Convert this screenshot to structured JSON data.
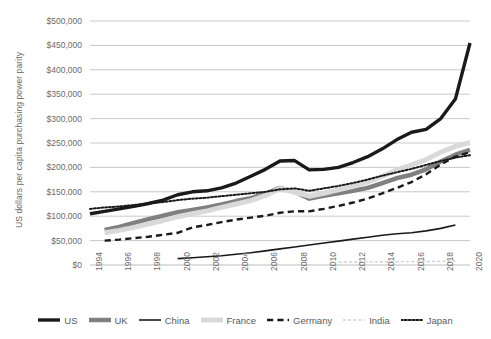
{
  "chart_data": {
    "type": "line",
    "title": "",
    "xlabel": "",
    "ylabel": "US dollars per capita purchasing power parity",
    "xlim": [
      1994,
      2020
    ],
    "ylim": [
      0,
      500000
    ],
    "ytick_labels": [
      "$500,000",
      "$450,000",
      "$400,000",
      "$350,000",
      "$300,000",
      "$250,000",
      "$200,000",
      "$150,000",
      "$100,000",
      "$50,000",
      "$0"
    ],
    "ytick_values": [
      500000,
      450000,
      400000,
      350000,
      300000,
      250000,
      200000,
      150000,
      100000,
      50000,
      0
    ],
    "xtick_labels": [
      "1994",
      "1996",
      "1998",
      "2000",
      "2002",
      "2004",
      "2006",
      "2008",
      "2010",
      "2012",
      "2014",
      "2016",
      "2018",
      "2020"
    ],
    "xtick_values": [
      1994,
      1996,
      1998,
      2000,
      2002,
      2004,
      2006,
      2008,
      2010,
      2012,
      2014,
      2016,
      2018,
      2020
    ],
    "grid": "horizontal",
    "legend_position": "bottom",
    "x": [
      1994,
      1995,
      1996,
      1997,
      1998,
      1999,
      2000,
      2001,
      2002,
      2003,
      2004,
      2005,
      2006,
      2007,
      2008,
      2009,
      2010,
      2011,
      2012,
      2013,
      2014,
      2015,
      2016,
      2017,
      2018,
      2019,
      2020
    ],
    "series": [
      {
        "name": "US",
        "color": "#1a1a1a",
        "style": "solid",
        "width": 3.4,
        "values": [
          105000,
          110000,
          115000,
          120000,
          126000,
          133000,
          144000,
          150000,
          152000,
          158000,
          168000,
          182000,
          196000,
          213000,
          214000,
          195000,
          196000,
          200000,
          210000,
          222000,
          238000,
          257000,
          272000,
          278000,
          300000,
          340000,
          455000
        ]
      },
      {
        "name": "UK",
        "color": "#808080",
        "style": "solid",
        "width": 4.5,
        "values": [
          null,
          72000,
          78000,
          86000,
          94000,
          101000,
          108000,
          113000,
          118000,
          124000,
          131000,
          137000,
          146000,
          158000,
          150000,
          136000,
          142000,
          147000,
          152000,
          158000,
          168000,
          178000,
          185000,
          196000,
          212000,
          226000,
          236000
        ]
      },
      {
        "name": "China",
        "color": "#1a1a1a",
        "style": "solid",
        "width": 1.6,
        "values": [
          null,
          null,
          null,
          null,
          null,
          null,
          13000,
          15000,
          17000,
          19000,
          22000,
          25000,
          29000,
          33000,
          37000,
          41000,
          45000,
          49000,
          53000,
          57000,
          61000,
          64000,
          66000,
          70000,
          75000,
          82000,
          null
        ]
      },
      {
        "name": "France",
        "color": "#d9d9d9",
        "style": "solid",
        "width": 5.0,
        "values": [
          null,
          66000,
          71000,
          77000,
          84000,
          91000,
          99000,
          105000,
          111000,
          118000,
          125000,
          132000,
          142000,
          157000,
          149000,
          141000,
          147000,
          154000,
          161000,
          170000,
          182000,
          195000,
          205000,
          216000,
          231000,
          243000,
          251000
        ]
      },
      {
        "name": "Germany",
        "color": "#1a1a1a",
        "style": "dashed",
        "width": 2.4,
        "values": [
          null,
          50000,
          52000,
          55000,
          58000,
          62000,
          66000,
          77000,
          82000,
          88000,
          93000,
          97000,
          101000,
          107000,
          110000,
          110000,
          115000,
          121000,
          128000,
          136000,
          147000,
          158000,
          170000,
          186000,
          206000,
          222000,
          231000
        ]
      },
      {
        "name": "India",
        "color": "#cfcfcf",
        "style": "dashed-fine",
        "width": 1.4,
        "values": [
          null,
          null,
          null,
          null,
          null,
          null,
          null,
          null,
          null,
          null,
          null,
          null,
          null,
          null,
          null,
          null,
          null,
          6000,
          6200,
          6400,
          6600,
          6800,
          7000,
          7200,
          7500,
          7800,
          null
        ]
      },
      {
        "name": "Japan",
        "color": "#1a1a1a",
        "style": "dotted",
        "width": 2.0,
        "values": [
          115000,
          118000,
          120000,
          123000,
          126000,
          129000,
          133000,
          136000,
          138000,
          141000,
          144000,
          147000,
          150000,
          155000,
          157000,
          152000,
          157000,
          162000,
          168000,
          175000,
          183000,
          190000,
          197000,
          205000,
          213000,
          220000,
          225000
        ]
      }
    ]
  },
  "legend": {
    "items": [
      {
        "label": "US"
      },
      {
        "label": "UK"
      },
      {
        "label": "China"
      },
      {
        "label": "France"
      },
      {
        "label": "Germany"
      },
      {
        "label": "India"
      },
      {
        "label": "Japan"
      }
    ]
  }
}
